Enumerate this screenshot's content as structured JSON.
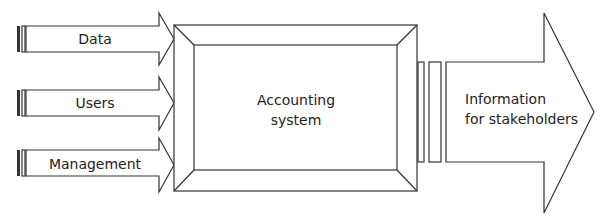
{
  "diagram": {
    "inputs": [
      {
        "label": "Data"
      },
      {
        "label": "Users"
      },
      {
        "label": "Management"
      }
    ],
    "system": {
      "line1": "Accounting",
      "line2": "system"
    },
    "output": {
      "line1": "Information",
      "line2": "for stakeholders"
    },
    "colors": {
      "stroke": "#333333",
      "fill": "#ffffff",
      "text": "#222222"
    }
  }
}
